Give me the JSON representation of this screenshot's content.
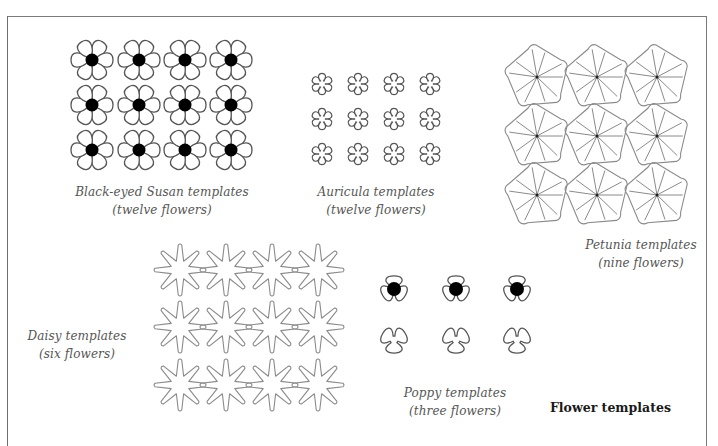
{
  "page": {
    "title": "Flower templates"
  },
  "groups": [
    {
      "id": "black-eyed-susan",
      "name": "Black-eyed Susan templates",
      "count_label": "(twelve flowers)",
      "flower_count": 12,
      "shape": "six-petal-with-black-center"
    },
    {
      "id": "auricula",
      "name": "Auricula templates",
      "count_label": "(twelve flowers)",
      "flower_count": 12,
      "shape": "six-petal-outline"
    },
    {
      "id": "petunia",
      "name": "Petunia templates",
      "count_label": "(nine flowers)",
      "flower_count": 9,
      "shape": "pinwheel-pentagon"
    },
    {
      "id": "daisy",
      "name": "Daisy templates",
      "count_label": "(six flowers)",
      "flower_count": 12,
      "shape": "eight-point-star"
    },
    {
      "id": "poppy",
      "name": "Poppy templates",
      "count_label": "(three flowers)",
      "flower_count": 6,
      "shape": "three-petal-with-black-center"
    }
  ],
  "colors": {
    "outline": "#555555",
    "center_fill": "#000000",
    "light_outline": "#8a8a8a"
  }
}
